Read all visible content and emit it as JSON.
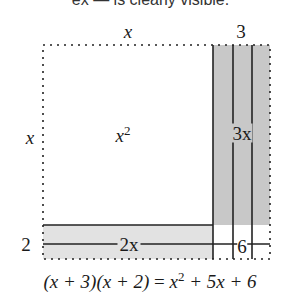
{
  "caption_fragment": "ex — is clearly visible.",
  "diagram": {
    "type": "area-model-factoring",
    "colors": {
      "outline": "#222222",
      "shade_light": "#e2e2e2",
      "shade_dark": "#c8c8c8",
      "background": "#ffffff"
    },
    "top_labels": {
      "left": "x",
      "right": "3"
    },
    "side_labels": {
      "top": "x",
      "bottom": "2"
    },
    "regions": {
      "x_squared": {
        "var": "x",
        "exp": "2"
      },
      "three_x": "3x",
      "two_x": "2x",
      "six": "6"
    },
    "equation": {
      "lhs": "(x + 3)(x + 2)",
      "eq": " = ",
      "rhs_a": "x",
      "rhs_a_exp": "2",
      "rhs_b": " + 5x + 6"
    }
  }
}
